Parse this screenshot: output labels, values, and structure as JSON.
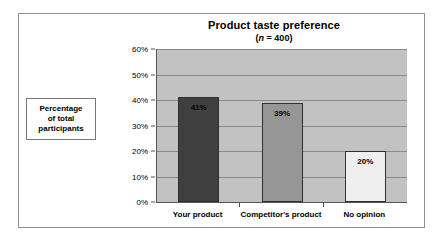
{
  "chart_data": {
    "type": "bar",
    "title": "Product taste preference",
    "subtitle_prefix": "(",
    "subtitle_italic": "n",
    "subtitle_suffix": " = 400)",
    "subtitle": "(n = 400)",
    "xlabel": "",
    "ylabel": "Percentage of total participants",
    "categories": [
      "Your product",
      "Competitor's product",
      "No opinion"
    ],
    "values": [
      41,
      39,
      20
    ],
    "value_labels": [
      "41%",
      "39%",
      "20%"
    ],
    "ylim": [
      0,
      60
    ],
    "ytick_values": [
      0,
      10,
      20,
      30,
      40,
      50,
      60
    ],
    "ytick_labels": [
      "0%",
      "10%",
      "20%",
      "30%",
      "40%",
      "50%",
      "60%"
    ],
    "grid": true,
    "legend": "none",
    "bar_colors": [
      "#3f3f3f",
      "#969696",
      "#efefef"
    ],
    "plot_background": "#c2c2c2",
    "gridline_color": "#8a8a8a",
    "axis_color": "#555555",
    "frame_color": "#8e8e8e"
  },
  "y_axis_label_box": {
    "line1": "Percentage",
    "line2": "of total",
    "line3": "participants"
  }
}
